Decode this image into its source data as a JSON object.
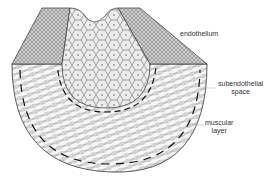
{
  "diagram": {
    "labels": {
      "endothelium": "endothelium",
      "subendothelial_line1": "subendothelial",
      "subendothelial_line2": "space",
      "muscular_line1": "muscular",
      "muscular_line2": "layer"
    },
    "colors": {
      "ink": "#333333",
      "lumen_fill": "#e8e8e8",
      "wall_fill": "#f4f4f4",
      "top_band_fill": "#bdbdbd",
      "background": "#ffffff"
    }
  }
}
